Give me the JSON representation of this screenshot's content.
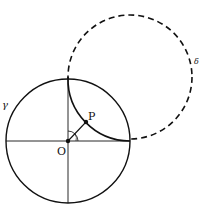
{
  "diagram": {
    "type": "geometry",
    "circles": [
      {
        "name": "gamma",
        "label": "γ",
        "style": "solid",
        "cx": 68,
        "cy": 141,
        "r": 62
      },
      {
        "name": "delta",
        "label": "δ",
        "style": "dashed",
        "cx": 130,
        "cy": 77,
        "r": 62
      }
    ],
    "points": [
      {
        "name": "O",
        "label": "O",
        "x": 68,
        "y": 141
      },
      {
        "name": "P",
        "label": "P",
        "x": 86,
        "y": 122
      }
    ],
    "axes": {
      "horizontal": true,
      "vertical": true
    },
    "colors": {
      "stroke": "#111111",
      "background": "#ffffff"
    }
  },
  "labels": {
    "gamma": "γ",
    "delta": "δ",
    "O": "O",
    "P": "P"
  }
}
